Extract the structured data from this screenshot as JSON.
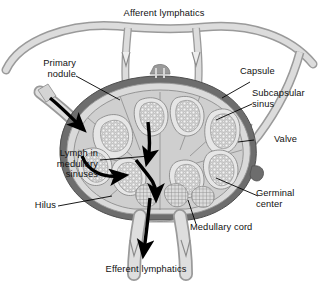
{
  "figure": {
    "background": "#ffffff",
    "width": 319,
    "height": 283
  },
  "labels": {
    "afferent_lymphatics": "Afferent lymphatics",
    "primary_nodule": "Primary\nnodule",
    "capsule": "Capsule",
    "subcapsular_sinus": "Subcapsular\nsinus",
    "valve": "Valve",
    "lymph_in_medullary_sinuses": "Lymph in\nmedullary\nsinuses",
    "germinal_center": "Germinal\ncenter",
    "medullary_cord": "Medullary cord",
    "hilus": "Hilus",
    "efferent_lymphatics": "Efferent lymphatics"
  },
  "colors": {
    "capsule": "#6d6d6d",
    "capsule_dark": "#5a5a5a",
    "subcapsular_sinus": "#d9d9d9",
    "vessel_fill": "#d6d6d6",
    "vessel_stroke": "#8a8a8a",
    "cortex_fill": "#cfcfcf",
    "follicle_fill": "#e8e8e8",
    "germinal_fill": "#f2f2f2",
    "medulla_fill": "#c4c4c4",
    "arrow": "#000000",
    "leader": "#000000",
    "text": "#111111"
  }
}
